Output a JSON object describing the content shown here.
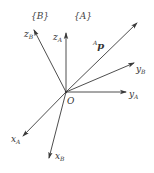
{
  "diagram": {
    "frames": {
      "B": "{B}",
      "A": "{A}"
    },
    "origin_label": "O",
    "axes": [
      {
        "id": "z_B",
        "main": "z",
        "sub": "B"
      },
      {
        "id": "z_A",
        "main": "z",
        "sub": "A"
      },
      {
        "id": "p_A",
        "pre_sup": "A",
        "main": "p"
      },
      {
        "id": "y_B",
        "main": "y",
        "sub": "B"
      },
      {
        "id": "y_A",
        "main": "y",
        "sub": "A"
      },
      {
        "id": "x_A",
        "main": "x",
        "sub": "A"
      },
      {
        "id": "x_B",
        "main": "x",
        "sub": "B"
      }
    ],
    "line_color": "#3a3a3a"
  }
}
